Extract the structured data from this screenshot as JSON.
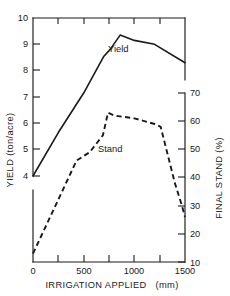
{
  "chart_data": {
    "type": "line",
    "title": "",
    "xlabel": "IRRIGATION APPLIED  (mm)",
    "xlabel_main": "IRRIGATION APPLIED",
    "xlabel_unit": "(mm)",
    "ylabel": "YIELD (ton/acre)",
    "ylabel2": "FINAL STAND (%)",
    "xlim": [
      0,
      1500
    ],
    "ylim": [
      4,
      10
    ],
    "ylim2": [
      10,
      70
    ],
    "grid": false,
    "legend": "inline-labels",
    "x_ticks_major": [
      0,
      500,
      1000,
      1500
    ],
    "x_ticklabels": [
      "0",
      "500",
      "1000",
      "1500"
    ],
    "x_ticks_minor": [
      250,
      750,
      1250
    ],
    "y_ticks_left": [
      4,
      5,
      6,
      7,
      8,
      9,
      10
    ],
    "y_ticklabels_left": [
      "4",
      "5",
      "6",
      "7",
      "8",
      "9",
      "10"
    ],
    "y_left_axis_break": true,
    "y_ticks_right": [
      10,
      20,
      30,
      40,
      50,
      60,
      70
    ],
    "y_ticklabels_right": [
      "10",
      "20",
      "30",
      "40",
      "50",
      "60",
      "70"
    ],
    "series": [
      {
        "name": "Yield",
        "axis": "left",
        "style": "solid",
        "units": "ton/acre",
        "label_text": "Yield",
        "points": [
          [
            0,
            4.0
          ],
          [
            250,
            5.65
          ],
          [
            500,
            7.15
          ],
          [
            700,
            8.55
          ],
          [
            760,
            8.8
          ],
          [
            860,
            9.35
          ],
          [
            1000,
            9.15
          ],
          [
            1200,
            9.0
          ],
          [
            1500,
            8.3
          ]
        ]
      },
      {
        "name": "Stand",
        "axis": "right",
        "style": "dashed",
        "units": "%",
        "label_text": "Stand",
        "points": [
          [
            0,
            13
          ],
          [
            430,
            46
          ],
          [
            560,
            49
          ],
          [
            690,
            55
          ],
          [
            740,
            63
          ],
          [
            800,
            62
          ],
          [
            1000,
            61
          ],
          [
            1200,
            59
          ],
          [
            1260,
            58
          ],
          [
            1400,
            38
          ],
          [
            1470,
            30
          ],
          [
            1500,
            26
          ]
        ]
      }
    ],
    "annotations": [
      {
        "name": "yield-series-label",
        "text": "Yield",
        "x": 900,
        "y": 8.75,
        "axis": "left"
      },
      {
        "name": "stand-series-label",
        "text": "Stand",
        "x": 800,
        "y": 50,
        "axis": "right"
      }
    ]
  },
  "axes": {
    "left_title": "YIELD (ton/acre)",
    "right_title": "FINAL STAND (%)",
    "bottom_title": "IRRIGATION APPLIED",
    "bottom_unit": "(mm)"
  }
}
